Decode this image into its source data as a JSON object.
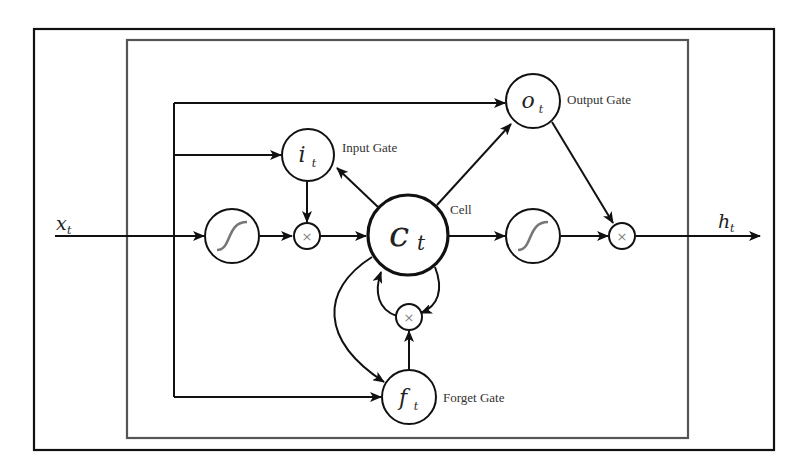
{
  "diagram": {
    "colors": {
      "stroke": "#111111",
      "inner_box": "#555555",
      "sigmoid_curve": "#777777",
      "times_glyph": "#888888",
      "label_text": "#333333",
      "background": "#ffffff"
    },
    "input": {
      "symbol": "x",
      "subscript": "t"
    },
    "output": {
      "symbol": "h",
      "subscript": "t"
    },
    "nodes": {
      "input_gate": {
        "symbol": "i",
        "subscript": "t",
        "label": "Input Gate"
      },
      "output_gate": {
        "symbol": "o",
        "subscript": "t",
        "label": "Output Gate"
      },
      "forget_gate": {
        "symbol": "f",
        "subscript": "t",
        "label": "Forget Gate"
      },
      "cell": {
        "symbol": "c",
        "subscript": "t",
        "label": "Cell"
      },
      "input_activation": {
        "icon": "sigmoid-icon"
      },
      "output_activation": {
        "icon": "sigmoid-icon"
      },
      "input_multiply": {
        "glyph": "×"
      },
      "forget_multiply": {
        "glyph": "×"
      },
      "output_multiply": {
        "glyph": "×"
      }
    },
    "edges": [
      {
        "from": "x_t",
        "to": "input_activation"
      },
      {
        "from": "x_t",
        "to": "input_gate"
      },
      {
        "from": "x_t",
        "to": "output_gate"
      },
      {
        "from": "x_t",
        "to": "forget_gate"
      },
      {
        "from": "input_activation",
        "to": "input_multiply"
      },
      {
        "from": "input_gate",
        "to": "input_multiply"
      },
      {
        "from": "input_multiply",
        "to": "cell"
      },
      {
        "from": "cell",
        "to": "input_gate"
      },
      {
        "from": "cell",
        "to": "output_gate"
      },
      {
        "from": "cell",
        "to": "forget_gate"
      },
      {
        "from": "cell",
        "to": "forget_multiply"
      },
      {
        "from": "forget_gate",
        "to": "forget_multiply"
      },
      {
        "from": "forget_multiply",
        "to": "cell"
      },
      {
        "from": "cell",
        "to": "output_activation"
      },
      {
        "from": "output_activation",
        "to": "output_multiply"
      },
      {
        "from": "output_gate",
        "to": "output_multiply"
      },
      {
        "from": "output_multiply",
        "to": "h_t"
      }
    ]
  }
}
